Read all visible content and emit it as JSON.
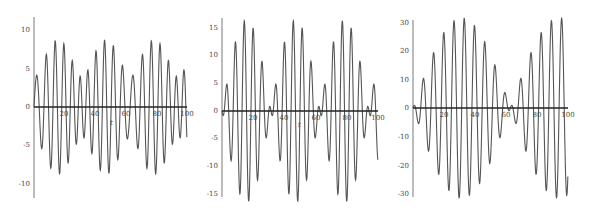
{
  "chart_data": [
    {
      "type": "line",
      "title": "",
      "xlabel": "t",
      "ylabel": "",
      "xlim": [
        0,
        100
      ],
      "ylim": [
        -12,
        12
      ],
      "xticks": [
        "20",
        "40",
        "60",
        "80",
        "100"
      ],
      "yticks": [
        "10",
        "5",
        "0",
        "-5",
        "-10"
      ],
      "grid": false,
      "legend": null,
      "formula_approx": "3.9*(sin(t)+sin(1.1t)-sin(1.2t))",
      "series": [
        {
          "name": "f1(t)",
          "peaks": [
            3.6,
            11.5,
            7.2,
            0.5,
            10,
            10,
            0.5,
            7.2,
            11.5,
            3.6,
            3.6,
            11.5,
            7.2,
            0.5,
            10,
            10
          ],
          "troughs": [
            -8.8,
            -11.2,
            -5.5,
            -1.8,
            -12,
            -5.5,
            -1.8,
            -11.2,
            -8.8,
            -8.8,
            -11.2,
            -5.5,
            -1.8,
            -12
          ]
        }
      ]
    },
    {
      "type": "line",
      "title": "",
      "xlabel": "t",
      "ylabel": "",
      "xlim": [
        0,
        100
      ],
      "ylim": [
        -16.5,
        16.5
      ],
      "xticks": [
        "20",
        "40",
        "60",
        "80",
        "100"
      ],
      "yticks": [
        "15",
        "10",
        "5",
        "0",
        "-5",
        "-10",
        "-15"
      ],
      "grid": false,
      "legend": null,
      "formula_approx": "8.25*(sin(t)-sin(1.2t))",
      "series": [
        {
          "name": "f2(t)",
          "peaks": [
            3.3,
            12.8,
            16.5,
            12.8,
            3.3,
            3.3,
            12.8,
            16.5,
            12.8,
            3.3,
            3.3,
            12.8,
            16.5,
            12.8,
            3.3,
            3.3
          ],
          "troughs": [
            -8.5,
            -15.5,
            -15.5,
            -8.5,
            -8.5,
            -15.5,
            -15.5,
            -8.5,
            -8.5,
            -15.5,
            -15.5,
            -8.5
          ],
          "end_value": -8.5
        }
      ]
    },
    {
      "type": "line",
      "title": "",
      "xlabel": "t",
      "ylabel": "",
      "xlim": [
        0,
        100
      ],
      "ylim": [
        -31.4,
        31.4
      ],
      "xticks": [
        "20",
        "40",
        "60",
        "80",
        "100"
      ],
      "yticks": [
        "30",
        "20",
        "10",
        "0",
        "-10",
        "-20",
        "-30"
      ],
      "grid": false,
      "legend": null,
      "formula_approx": "15.7*(sin(t)-sin(0.9t))",
      "series": [
        {
          "name": "f3(t)",
          "peaks": [
            3,
            12.5,
            21.5,
            28,
            31,
            31,
            28,
            21.5,
            12.5,
            3,
            3,
            12.5,
            21.5,
            28,
            31,
            31
          ],
          "troughs": [
            -8,
            -17.5,
            -25,
            -30,
            -31.4,
            -30,
            -25,
            -17.5,
            -8,
            -8,
            -17.5,
            -25,
            -30,
            -31.4
          ],
          "end_value": -21
        }
      ]
    }
  ],
  "panels": [
    {
      "xlabel": "t",
      "xticks": [
        "20",
        "40",
        "60",
        "80",
        "100"
      ],
      "yticks": [
        "10",
        "5",
        "0",
        "-5",
        "-10"
      ]
    },
    {
      "xlabel": "t",
      "xticks": [
        "20",
        "40",
        "60",
        "80",
        "100"
      ],
      "yticks": [
        "15",
        "10",
        "5",
        "0",
        "-5",
        "-10",
        "-15"
      ]
    },
    {
      "xlabel": "",
      "xticks": [
        "20",
        "40",
        "60",
        "80",
        "100"
      ],
      "yticks": [
        "30",
        "20",
        "10",
        "0",
        "-10",
        "-20",
        "-30"
      ]
    }
  ]
}
